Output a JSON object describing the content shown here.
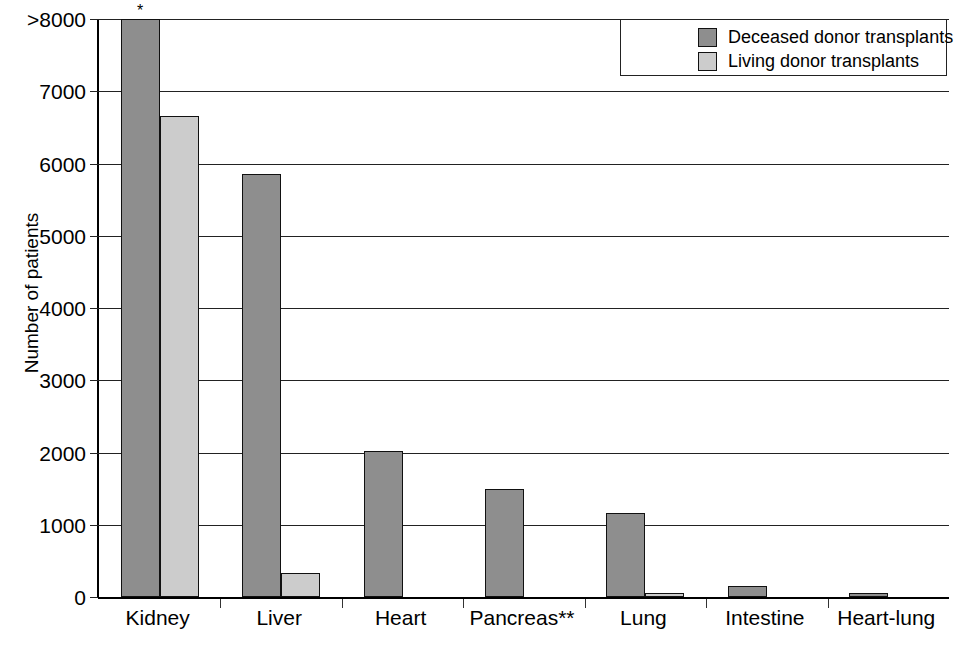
{
  "chart_data": {
    "type": "bar",
    "title": "",
    "xlabel": "",
    "ylabel": "Number of patients",
    "categories": [
      "Kidney",
      "Liver",
      "Heart",
      "Pancreas**",
      "Lung",
      "Intestine",
      "Heart-lung"
    ],
    "series": [
      {
        "name": "Deceased donor transplants",
        "color": "#8e8e8e",
        "values": [
          8000,
          5860,
          2020,
          1490,
          1160,
          150,
          40
        ]
      },
      {
        "name": "Living donor transplants",
        "color": "#cccccc",
        "values": [
          6660,
          330,
          0,
          0,
          30,
          0,
          0
        ]
      }
    ],
    "ylim": [
      0,
      8000
    ],
    "yticks": [
      0,
      1000,
      2000,
      3000,
      4000,
      5000,
      6000,
      7000,
      8000
    ],
    "ytick_labels": [
      "0",
      "1000",
      "2000",
      "3000",
      "4000",
      "5000",
      "6000",
      "7000",
      ">8000"
    ],
    "grid": true,
    "legend_position": "top-right",
    "annotations": [
      {
        "text": "*",
        "category": "Kidney",
        "series": "Deceased donor transplants"
      }
    ],
    "footnote_markers": [
      "*",
      "**"
    ]
  },
  "legend": {
    "entries": [
      {
        "label": "Deceased donor transplants",
        "swatch": "deceased"
      },
      {
        "label": "Living donor transplants",
        "swatch": "living"
      }
    ]
  }
}
